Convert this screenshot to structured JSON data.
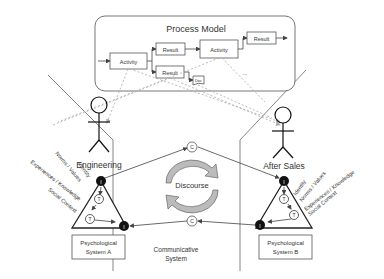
{
  "process_model": {
    "title": "Process Model",
    "activity_1": "Activity",
    "result_1": "Result",
    "result_2": "Result",
    "activity_2": "Activity",
    "result_3": "Result",
    "doc": "Doc",
    "ellipsis": "..."
  },
  "actors": {
    "left": "Engineering",
    "right": "After Sales"
  },
  "psych_a": {
    "line1": "Psychological",
    "line2": "System A",
    "labels": [
      "Identity",
      "Norms / Values",
      "Experiences / Knowledge",
      "Social Context"
    ],
    "node_i": "I",
    "node_t": "T"
  },
  "psych_b": {
    "line1": "Psychological",
    "line2": "System B",
    "labels": [
      "Identity",
      "Norms / Values",
      "Experiences / Knowledge",
      "Social Context"
    ],
    "node_i": "I",
    "node_t": "T"
  },
  "communicative": {
    "node_c": "C",
    "discourse": "Discourse",
    "line1": "Communicative",
    "line2": "System"
  }
}
